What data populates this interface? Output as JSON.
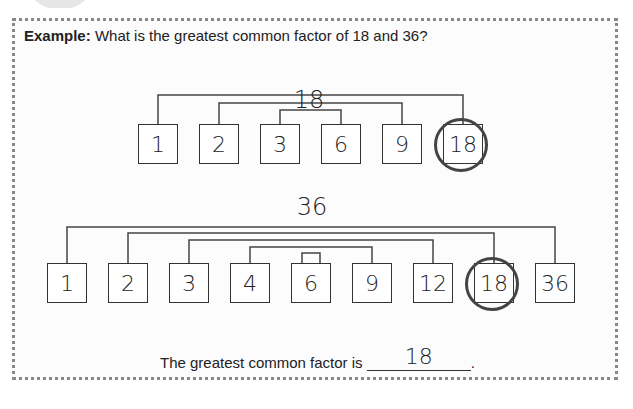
{
  "example": {
    "label": "Example:",
    "question": "What is the greatest common factor of 18 and 36?"
  },
  "tree_18": {
    "number": "18",
    "factors": [
      "1",
      "2",
      "3",
      "6",
      "9",
      "18"
    ],
    "circled": "18"
  },
  "tree_36": {
    "number": "36",
    "factors": [
      "1",
      "2",
      "3",
      "4",
      "6",
      "9",
      "12",
      "18",
      "36"
    ],
    "circled": "18"
  },
  "answer": {
    "prefix": "The greatest common factor is",
    "value": "18",
    "suffix": "."
  }
}
